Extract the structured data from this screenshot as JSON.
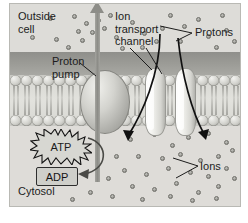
{
  "figure": {
    "caption_faint": "",
    "colors": {
      "outside_region": "#dddcd8",
      "outer_band": "#9a9a95",
      "cytosol_region": "#dedcd8",
      "bilayer": "#dcdcd7",
      "ion_dot": "#9d9d98",
      "arrow_black": "#111111",
      "pump_arrow": "#8d8d88",
      "frame_border": "#b9b9b4"
    }
  },
  "labels": {
    "outside_cell": "Outside\ncell",
    "ion_transport_channel": "Ion\ntransport\nchannel",
    "protons": "Protons",
    "proton_pump": "Proton\npump",
    "ions": "Ions",
    "cytosol": "Cytosol",
    "atp": "ATP",
    "adp": "ADP"
  },
  "structures": [
    {
      "name": "proton-pump",
      "kind": "oval-protein",
      "label": "Proton pump"
    },
    {
      "name": "ion-transport-channel",
      "kind": "two-subunit-channel",
      "label": "Ion transport channel"
    },
    {
      "name": "lipid-bilayer",
      "kind": "phospholipid-bilayer",
      "label": "Lipid bilayer"
    }
  ],
  "particles": {
    "outside_dots": [
      [
        38,
        12
      ],
      [
        62,
        10
      ],
      [
        74,
        17
      ],
      [
        86,
        14
      ],
      [
        98,
        9
      ],
      [
        66,
        25
      ],
      [
        80,
        26
      ],
      [
        92,
        22
      ],
      [
        20,
        31
      ],
      [
        44,
        33
      ],
      [
        70,
        34
      ],
      [
        104,
        31
      ],
      [
        120,
        16
      ],
      [
        132,
        27
      ],
      [
        144,
        35
      ],
      [
        158,
        9
      ],
      [
        172,
        20
      ],
      [
        186,
        13
      ],
      [
        196,
        30
      ],
      [
        210,
        9
      ],
      [
        214,
        24
      ],
      [
        222,
        35
      ],
      [
        150,
        22
      ],
      [
        168,
        35
      ],
      [
        204,
        41
      ],
      [
        56,
        41
      ],
      [
        110,
        42
      ],
      [
        130,
        41
      ]
    ],
    "cytosol_dots": [
      [
        118,
        133
      ],
      [
        142,
        128
      ],
      [
        160,
        139
      ],
      [
        176,
        131
      ],
      [
        196,
        127
      ],
      [
        214,
        136
      ],
      [
        126,
        150
      ],
      [
        150,
        152
      ],
      [
        168,
        148
      ],
      [
        188,
        154
      ],
      [
        206,
        150
      ],
      [
        220,
        144
      ],
      [
        112,
        164
      ],
      [
        134,
        168
      ],
      [
        156,
        162
      ],
      [
        178,
        166
      ],
      [
        196,
        170
      ],
      [
        214,
        162
      ],
      [
        120,
        180
      ],
      [
        142,
        183
      ],
      [
        164,
        177
      ],
      [
        186,
        186
      ],
      [
        206,
        180
      ],
      [
        222,
        172
      ],
      [
        100,
        190
      ],
      [
        130,
        193
      ],
      [
        158,
        190
      ],
      [
        180,
        194
      ],
      [
        204,
        192
      ],
      [
        78,
        186
      ],
      [
        96,
        172
      ],
      [
        60,
        193
      ],
      [
        104,
        150
      ]
    ],
    "proton_leader_targets": [
      [
        150,
        22
      ],
      [
        168,
        35
      ]
    ],
    "ion_leader_targets": [
      [
        162,
        162
      ],
      [
        170,
        180
      ]
    ]
  },
  "flows": [
    {
      "name": "proton-pump-efflux",
      "direction": "outward",
      "description": "Protons pumped from cytosol to outside cell"
    },
    {
      "name": "channel-influx-left",
      "direction": "inward",
      "description": "Ions flow down gradient into cytosol"
    },
    {
      "name": "channel-influx-right",
      "direction": "inward",
      "description": "Ions flow down gradient into cytosol"
    },
    {
      "name": "atp-hydrolysis",
      "direction": "atp-to-adp",
      "description": "ATP hydrolysed to ADP powering the pump"
    }
  ]
}
